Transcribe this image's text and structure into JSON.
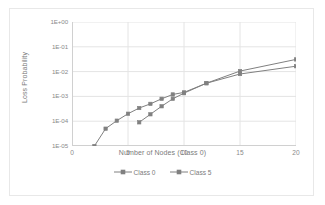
{
  "chart_data": {
    "type": "line",
    "title": "",
    "xlabel": "Number of Nodes (Class 0)",
    "ylabel": "Loss Probability",
    "yscale": "log",
    "ylim": [
      1e-05,
      1
    ],
    "xlim": [
      0,
      20
    ],
    "grid": true,
    "legend_position": "bottom",
    "y_tick_labels": [
      "1E+00",
      "1E-01",
      "1E-02",
      "1E-03",
      "1E-04",
      "1E-05"
    ],
    "y_tick_values": [
      1,
      0.1,
      0.01,
      0.001,
      0.0001,
      1e-05
    ],
    "x_tick_labels": [
      "0",
      "5",
      "10",
      "15",
      "20"
    ],
    "x_tick_values": [
      0,
      5,
      10,
      15,
      20
    ],
    "series": [
      {
        "name": "Class 0",
        "color": "#808080",
        "marker": "square",
        "x": [
          2,
          3,
          4,
          5,
          6,
          7,
          8,
          9,
          10,
          12,
          15,
          20
        ],
        "values": [
          1e-05,
          5e-05,
          0.000105,
          0.0002,
          0.00034,
          0.0005,
          0.0008,
          0.0012,
          0.00145,
          0.0034,
          0.0105,
          0.031
        ]
      },
      {
        "name": "Class 5",
        "color": "#808080",
        "marker": "square",
        "x": [
          6,
          7,
          8,
          9,
          10,
          12,
          15,
          20
        ],
        "values": [
          9e-05,
          0.00019,
          0.0004,
          0.0008,
          0.00135,
          0.0034,
          0.008,
          0.0165
        ]
      }
    ]
  },
  "legend": {
    "entries": [
      {
        "label": "Class 0"
      },
      {
        "label": "Class 5"
      }
    ]
  },
  "colors": {
    "series": "#808080",
    "gridline": "#e4e4e4",
    "axis": "#d0d0d0",
    "text": "#7b7b7b",
    "border": "#e8e8e8",
    "background": "#ffffff"
  }
}
